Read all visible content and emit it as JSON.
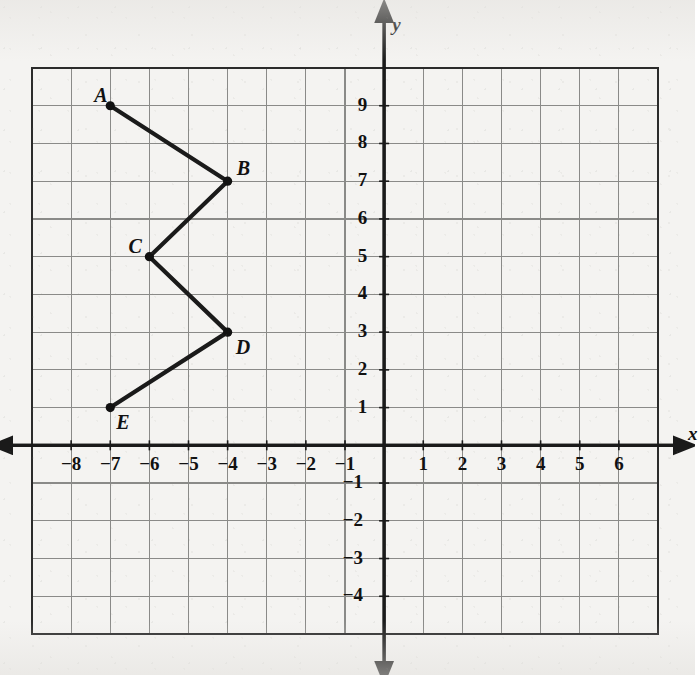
{
  "chart_data": {
    "type": "line",
    "title": "",
    "xlabel": "x",
    "ylabel": "y",
    "xlim": [
      -9,
      7
    ],
    "ylim": [
      -5,
      10
    ],
    "grid": true,
    "legend": "none",
    "x_tick_labels": [
      "-8",
      "-7",
      "-6",
      "-5",
      "-4",
      "-3",
      "-2",
      "-1",
      "1",
      "2",
      "3",
      "4",
      "5",
      "6"
    ],
    "x_tick_values": [
      -8,
      -7,
      -6,
      -5,
      -4,
      -3,
      -2,
      -1,
      1,
      2,
      3,
      4,
      5,
      6
    ],
    "y_tick_labels": [
      "9",
      "8",
      "7",
      "6",
      "5",
      "4",
      "3",
      "2",
      "1",
      "-1",
      "-2",
      "-3",
      "-4"
    ],
    "y_tick_values": [
      9,
      8,
      7,
      6,
      5,
      4,
      3,
      2,
      1,
      -1,
      -2,
      -3,
      -4
    ],
    "series": [
      {
        "name": "polyline-ABCDE",
        "points": [
          {
            "label": "A",
            "x": -7,
            "y": 9,
            "label_dx": -16,
            "label_dy": -22
          },
          {
            "label": "B",
            "x": -4,
            "y": 7,
            "label_dx": 9,
            "label_dy": -24
          },
          {
            "label": "C",
            "x": -6,
            "y": 5,
            "label_dx": -21,
            "label_dy": -22
          },
          {
            "label": "D",
            "x": -4,
            "y": 3,
            "label_dx": 8,
            "label_dy": 4
          },
          {
            "label": "E",
            "x": -7,
            "y": 1,
            "label_dx": 6,
            "label_dy": 3
          }
        ]
      }
    ],
    "colors": {
      "paper": "#f4f3f1",
      "grid_line": "#8a8a88",
      "axis_line": "#1a1a1a",
      "border": "#2b2b2b",
      "polyline": "#1a1a1a",
      "vertex_dot": "#111111"
    }
  },
  "axes": {
    "x_axis_name": "x",
    "y_axis_name": "y"
  }
}
